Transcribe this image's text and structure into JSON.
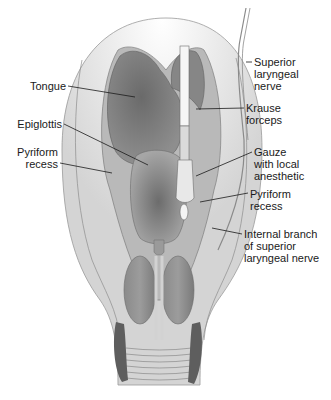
{
  "figure": {
    "colors": {
      "background": "#ffffff",
      "tissue_outer": "#d6d6d6",
      "tissue_mid": "#c4c4c4",
      "tissue_dark": "#7d7d7d",
      "cavity_dark": "#6e6e6e",
      "epiglottis": "#8a8a8a",
      "outline": "#8c8c8c",
      "instrument": "#f4f4f4",
      "leader_line": "#1a1a1a"
    }
  },
  "labels": {
    "tongue": "Tongue",
    "epiglottis": "Epiglottis",
    "pyriform_recess_left": "Pyriform\nrecess",
    "superior_laryngeal_nerve": "Superior\nlaryngeal\nnerve",
    "krause_forceps": "Krause\nforceps",
    "gauze": "Gauze\nwith local\nanesthetic",
    "pyriform_recess_right": "Pyriform\nrecess",
    "internal_branch": "Internal branch\nof superior\nlaryngeal nerve"
  }
}
